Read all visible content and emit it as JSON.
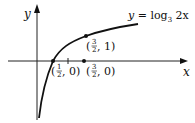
{
  "figure": {
    "axes": {
      "x_label": "x",
      "y_label": "y"
    },
    "function_label": {
      "prefix": "y = log",
      "base": "3",
      "arg": " 2x"
    },
    "points": [
      {
        "id": "x-intercept",
        "x": "1/2",
        "y": "0",
        "label_open": "(",
        "frac_num": "1",
        "frac_den": "2",
        "label_rest": ", 0)"
      },
      {
        "id": "point-on-curve",
        "x": "3/2",
        "y": "1",
        "label_open": "(",
        "frac_num": "3",
        "frac_den": "2",
        "label_rest": ", 1)"
      },
      {
        "id": "point-on-axis",
        "x": "3/2",
        "y": "0",
        "label_open": "(",
        "frac_num": "3",
        "frac_den": "2",
        "label_rest": ", 0)"
      }
    ],
    "tick": {
      "x": "1"
    }
  }
}
